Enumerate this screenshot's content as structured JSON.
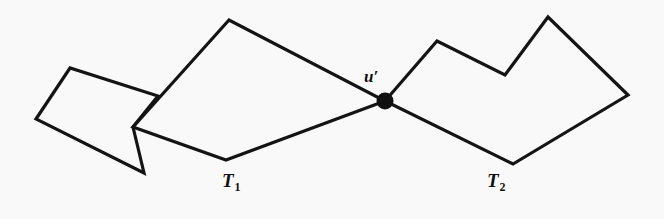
{
  "figure": {
    "background_color": "#f9f9f9",
    "stroke_color": "#141414",
    "stroke_width": 3.2,
    "node_color": "#101010",
    "labels": {
      "node": "u",
      "node_prime": "′",
      "tree_left_base": "T",
      "tree_left_sub": "1",
      "tree_right_base": "T",
      "tree_right_sub": "2"
    },
    "node": {
      "name": "u-prime",
      "x": 385,
      "y": 101,
      "radius": 8.5
    },
    "polylines": [
      {
        "name": "tree-1-left-quad",
        "closed": true,
        "points": "70,68 36,119 144,173 133,127 158,96"
      },
      {
        "name": "tree-1-right-quad",
        "closed": true,
        "points": "229,20 133,127 226,160 385,101"
      }
    ],
    "tree2_path": {
      "name": "tree-2-outline",
      "closed": true,
      "points": "385,101 437,41 505,75 548,17 628,95 513,164"
    }
  }
}
